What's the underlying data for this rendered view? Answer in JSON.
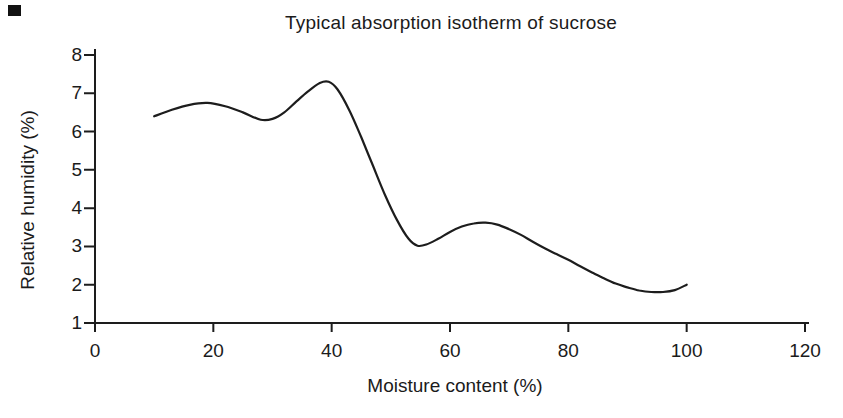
{
  "figure": {
    "background": "#ffffff",
    "ink_color": "#1b1b1b",
    "corner_mark_color": "#121212"
  },
  "chart_data": {
    "type": "line",
    "title": "Typical absorption isotherm of sucrose",
    "xlabel": "Moisture content (%)",
    "ylabel": "Relative humidity (%)",
    "xlim": [
      0,
      120
    ],
    "ylim": [
      1,
      8
    ],
    "xticks": [
      0,
      20,
      40,
      60,
      80,
      100,
      120
    ],
    "yticks": [
      1,
      2,
      3,
      4,
      5,
      6,
      7,
      8
    ],
    "grid": false,
    "legend": "none",
    "line_color": "#1d1d1d",
    "axis_color": "#1d1d1d",
    "series": [
      {
        "name": "sucrose absorption isotherm",
        "points": [
          [
            10,
            6.4
          ],
          [
            13,
            6.57
          ],
          [
            16,
            6.7
          ],
          [
            19,
            6.75
          ],
          [
            22,
            6.66
          ],
          [
            25,
            6.5
          ],
          [
            28,
            6.31
          ],
          [
            30,
            6.33
          ],
          [
            32,
            6.5
          ],
          [
            34,
            6.78
          ],
          [
            36,
            7.05
          ],
          [
            38,
            7.27
          ],
          [
            39.5,
            7.3
          ],
          [
            41,
            7.1
          ],
          [
            43,
            6.55
          ],
          [
            45,
            5.85
          ],
          [
            47,
            5.1
          ],
          [
            49,
            4.35
          ],
          [
            51,
            3.7
          ],
          [
            53,
            3.2
          ],
          [
            54.5,
            3.02
          ],
          [
            56,
            3.05
          ],
          [
            58,
            3.2
          ],
          [
            60,
            3.38
          ],
          [
            62,
            3.52
          ],
          [
            64,
            3.6
          ],
          [
            66,
            3.62
          ],
          [
            68,
            3.57
          ],
          [
            70,
            3.45
          ],
          [
            72,
            3.3
          ],
          [
            74,
            3.12
          ],
          [
            76,
            2.95
          ],
          [
            78,
            2.8
          ],
          [
            80,
            2.65
          ],
          [
            82,
            2.48
          ],
          [
            84,
            2.32
          ],
          [
            86,
            2.17
          ],
          [
            88,
            2.03
          ],
          [
            90,
            1.93
          ],
          [
            92,
            1.85
          ],
          [
            94,
            1.81
          ],
          [
            96,
            1.81
          ],
          [
            98,
            1.86
          ],
          [
            100,
            2.0
          ]
        ]
      }
    ]
  }
}
